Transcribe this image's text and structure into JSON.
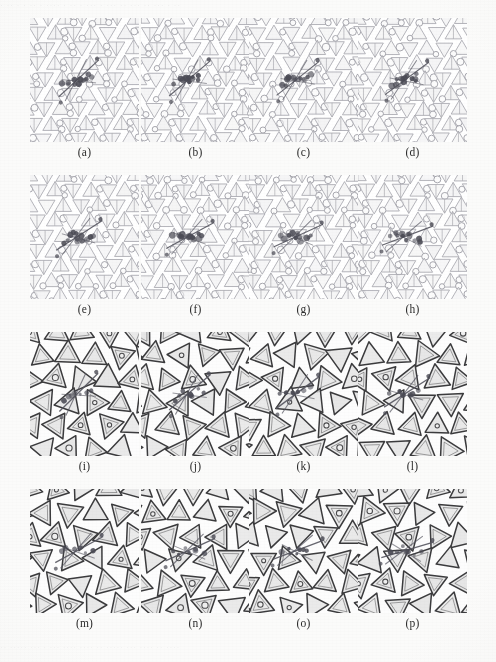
{
  "figure": {
    "kind": "multi-panel-micrograph-grid",
    "columns": 4,
    "rows": 4,
    "panel_count": 16,
    "background_color": "#fbfbfa",
    "panel_background_color": "#ffffff"
  },
  "scan_artifacts": {
    "top_bleed_text": "· ·· · ·  ·· · ···· · ·· ·  ···  · ··· ·· ··· ··  ··· · ··",
    "bottom_bleed_text": "··  ····· ··· · ··· ···· ···· ·· ····· ···  ···· ·· ····"
  },
  "styles": {
    "light_lattice": {
      "stroke_color": "#a9a9b0",
      "stroke_width": 0.85,
      "fill_color": "#f2f2f3",
      "node_stroke": "#9a9aa2",
      "node_fill": "#fcfcfc",
      "description": "pale grey triangle-and-circle kagome-like tiling"
    },
    "dark_lattice": {
      "stroke_color": "#3b3b3d",
      "stroke_width": 1.5,
      "fill_color": "#e6e6e6",
      "node_stroke": "#4a4a4c",
      "node_fill": "#f0f0f0",
      "description": "dark-outlined large triangle tiling"
    },
    "defect": {
      "atom_color": "#4b4b55",
      "bond_color": "#55555f",
      "description": "central dislocation core: dark atoms with connecting bonds"
    }
  },
  "panels": [
    {
      "id": "a",
      "label": "(a)",
      "row": 1,
      "col": 1,
      "style": "light_lattice",
      "defect_angle_deg": -32,
      "defect_seed": 11
    },
    {
      "id": "b",
      "label": "(b)",
      "row": 1,
      "col": 2,
      "style": "light_lattice",
      "defect_angle_deg": -30,
      "defect_seed": 22
    },
    {
      "id": "c",
      "label": "(c)",
      "row": 1,
      "col": 3,
      "style": "light_lattice",
      "defect_angle_deg": -28,
      "defect_seed": 33
    },
    {
      "id": "d",
      "label": "(d)",
      "row": 1,
      "col": 4,
      "style": "light_lattice",
      "defect_angle_deg": -26,
      "defect_seed": 44
    },
    {
      "id": "e",
      "label": "(e)",
      "row": 2,
      "col": 1,
      "style": "light_lattice",
      "defect_angle_deg": -22,
      "defect_seed": 55
    },
    {
      "id": "f",
      "label": "(f)",
      "row": 2,
      "col": 2,
      "style": "light_lattice",
      "defect_angle_deg": -18,
      "defect_seed": 66
    },
    {
      "id": "g",
      "label": "(g)",
      "row": 2,
      "col": 3,
      "style": "light_lattice",
      "defect_angle_deg": -14,
      "defect_seed": 77
    },
    {
      "id": "h",
      "label": "(h)",
      "row": 2,
      "col": 4,
      "style": "light_lattice",
      "defect_angle_deg": -10,
      "defect_seed": 88
    },
    {
      "id": "i",
      "label": "(i)",
      "row": 3,
      "col": 1,
      "style": "dark_lattice",
      "defect_angle_deg": -34,
      "defect_seed": 99
    },
    {
      "id": "j",
      "label": "(j)",
      "row": 3,
      "col": 2,
      "style": "dark_lattice",
      "defect_angle_deg": -30,
      "defect_seed": 110
    },
    {
      "id": "k",
      "label": "(k)",
      "row": 3,
      "col": 3,
      "style": "dark_lattice",
      "defect_angle_deg": -26,
      "defect_seed": 121
    },
    {
      "id": "l",
      "label": "(l)",
      "row": 3,
      "col": 4,
      "style": "dark_lattice",
      "defect_angle_deg": -22,
      "defect_seed": 132
    },
    {
      "id": "m",
      "label": "(m)",
      "row": 4,
      "col": 1,
      "style": "dark_lattice",
      "defect_angle_deg": -18,
      "defect_seed": 143
    },
    {
      "id": "n",
      "label": "(n)",
      "row": 4,
      "col": 2,
      "style": "dark_lattice",
      "defect_angle_deg": -14,
      "defect_seed": 154
    },
    {
      "id": "o",
      "label": "(o)",
      "row": 4,
      "col": 3,
      "style": "dark_lattice",
      "defect_angle_deg": -10,
      "defect_seed": 165
    },
    {
      "id": "p",
      "label": "(p)",
      "row": 4,
      "col": 4,
      "style": "dark_lattice",
      "defect_angle_deg": -6,
      "defect_seed": 176
    }
  ],
  "geometry": {
    "panel_width": 109,
    "panel_height": 124,
    "col_x": [
      30,
      141,
      249,
      358
    ],
    "row_y": [
      18,
      175,
      332,
      489
    ],
    "label_y": [
      146,
      303,
      460,
      617
    ],
    "label_width": 109
  }
}
